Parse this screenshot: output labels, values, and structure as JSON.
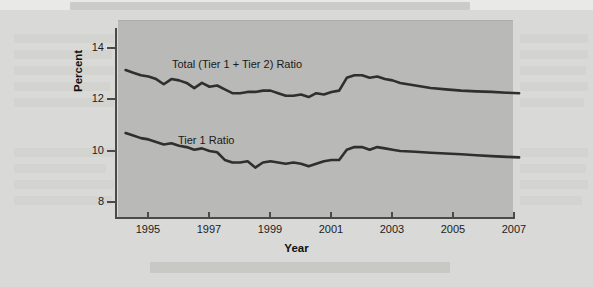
{
  "figure": {
    "plot_background_color": "#b9b9b7",
    "page_background_color": "#d9d9d7",
    "line_color": "#2f2f2f"
  },
  "axis": {
    "y_title": "Percent",
    "x_title": "Year",
    "y_ticks": [
      "14",
      "12",
      "10",
      "8"
    ],
    "x_ticks": [
      "1995",
      "1997",
      "1999",
      "2001",
      "2003",
      "2005",
      "2007"
    ]
  },
  "series_labels": {
    "total": "Total (Tier 1 + Tier 2) Ratio",
    "tier1": "Tier 1 Ratio"
  },
  "chart_data": {
    "type": "line",
    "title": "",
    "subtitle": "",
    "xlabel": "Year",
    "ylabel": "Percent",
    "xlim": [
      1994.3,
      2007.3
    ],
    "ylim": [
      7.0,
      14.6
    ],
    "ytick_values": [
      14,
      12,
      10,
      8
    ],
    "xtick_values": [
      1995,
      1997,
      1999,
      2001,
      2003,
      2005,
      2007
    ],
    "grid": false,
    "legend": "inline-labels",
    "legend_position": "inside-plot",
    "x": [
      1994.3,
      1994.55,
      1994.8,
      1995.05,
      1995.3,
      1995.55,
      1995.8,
      1996.05,
      1996.3,
      1996.55,
      1996.8,
      1997.05,
      1997.3,
      1997.55,
      1997.8,
      1998.05,
      1998.3,
      1998.55,
      1998.8,
      1999.05,
      1999.3,
      1999.55,
      1999.8,
      2000.05,
      2000.3,
      2000.55,
      2000.8,
      2001.05,
      2001.3,
      2001.55,
      2001.8,
      2002.05,
      2002.3,
      2002.55,
      2002.8,
      2003.05,
      2003.3,
      2003.8,
      2004.3,
      2004.8,
      2005.3,
      2005.8,
      2006.3,
      2006.8,
      2007.2
    ],
    "series": [
      {
        "name": "Total (Tier 1 + Tier 2) Ratio",
        "values": [
          13.1,
          13.0,
          12.9,
          12.85,
          12.75,
          12.55,
          12.75,
          12.7,
          12.6,
          12.4,
          12.6,
          12.45,
          12.5,
          12.35,
          12.2,
          12.2,
          12.25,
          12.25,
          12.3,
          12.3,
          12.2,
          12.1,
          12.1,
          12.15,
          12.05,
          12.2,
          12.15,
          12.25,
          12.3,
          12.8,
          12.9,
          12.9,
          12.8,
          12.85,
          12.75,
          12.7,
          12.6,
          12.5,
          12.4,
          12.35,
          12.3,
          12.27,
          12.25,
          12.22,
          12.2
        ]
      },
      {
        "name": "Tier 1 Ratio",
        "values": [
          10.65,
          10.55,
          10.45,
          10.4,
          10.3,
          10.2,
          10.25,
          10.15,
          10.1,
          10.0,
          10.05,
          9.95,
          9.9,
          9.6,
          9.5,
          9.5,
          9.55,
          9.3,
          9.5,
          9.55,
          9.5,
          9.45,
          9.5,
          9.45,
          9.35,
          9.45,
          9.55,
          9.6,
          9.6,
          10.0,
          10.1,
          10.1,
          10.0,
          10.1,
          10.05,
          10.0,
          9.95,
          9.92,
          9.88,
          9.85,
          9.82,
          9.78,
          9.75,
          9.72,
          9.7
        ]
      }
    ]
  }
}
